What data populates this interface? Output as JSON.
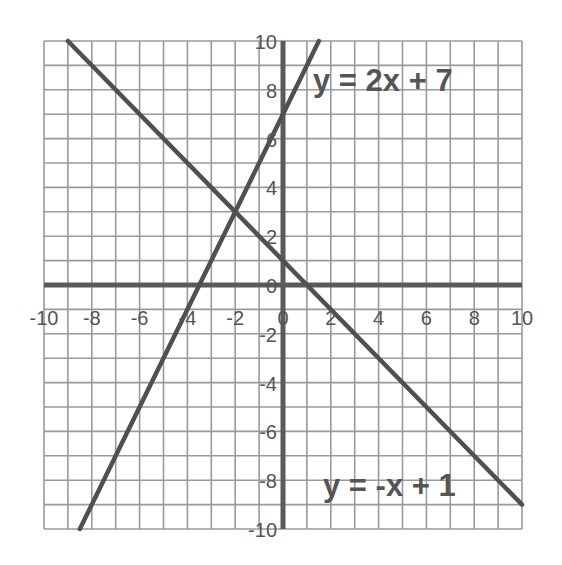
{
  "chart_data": {
    "type": "line",
    "title": "",
    "xlabel": "",
    "ylabel": "",
    "xlim": [
      -10,
      10
    ],
    "ylim": [
      -10,
      10
    ],
    "grid": true,
    "grid_step": 1,
    "x_ticks": [
      -10,
      -8,
      -6,
      -4,
      -2,
      0,
      2,
      4,
      6,
      8,
      10
    ],
    "y_ticks": [
      -10,
      -8,
      -6,
      -4,
      -2,
      0,
      2,
      4,
      6,
      8,
      10
    ],
    "x_tick_labels": [
      "-10",
      "-8",
      "-6",
      "-4",
      "-2",
      "0",
      "2",
      "4",
      "6",
      "8",
      "10"
    ],
    "y_tick_labels": [
      "-10",
      "-8",
      "-6",
      "-4",
      "-2",
      "0",
      "2",
      "4",
      "6",
      "8",
      "10"
    ],
    "series": [
      {
        "name": "y = 2x + 7",
        "slope": 2,
        "intercept": 7,
        "x": [
          -8.5,
          1.5
        ],
        "y": [
          -10,
          10
        ]
      },
      {
        "name": "y = -x + 1",
        "slope": -1,
        "intercept": 1,
        "x": [
          -9,
          10
        ],
        "y": [
          10,
          -9
        ]
      }
    ],
    "annotations": [
      {
        "text": "y = 2x + 7",
        "x": 1.3,
        "y": 8.3
      },
      {
        "text": "y = -x + 1",
        "x": 1.7,
        "y": -8.6
      }
    ],
    "intersection": {
      "x": -2,
      "y": 3
    }
  },
  "labels": {
    "eq1": "y = 2x + 7",
    "eq2": "y = -x + 1"
  },
  "colors": {
    "grid": "#9a9a9a",
    "axis": "#5a5a5a",
    "line": "#505050",
    "text": "#555555",
    "background": "#ffffff"
  }
}
